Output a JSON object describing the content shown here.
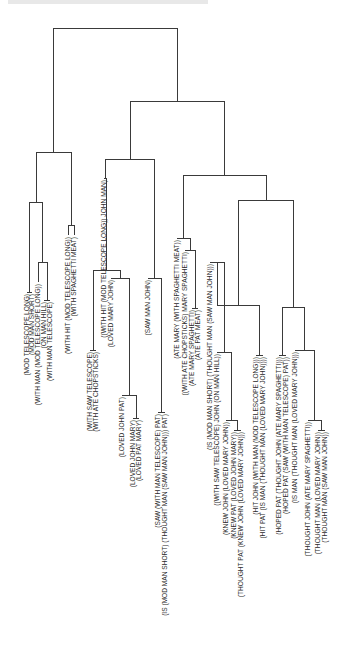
{
  "figure": {
    "type": "dendrogram",
    "orientation": "root-top, leaves-bottom, labels rotated -90deg",
    "line_color": "#3a3a3a",
    "background": "#ffffff"
  },
  "leaves": [
    {
      "id": "L1",
      "x": 27,
      "y": 292,
      "label": "(MOD TELESCOPE LONG)"
    },
    {
      "id": "L2",
      "x": 32,
      "y": 292,
      "label": "(MOD MAN SHORT)"
    },
    {
      "id": "L3",
      "x": 38,
      "y": 282,
      "label": "(WITH MAN (MOD TELESCOPE LONG))"
    },
    {
      "id": "L4",
      "x": 44,
      "y": 300,
      "label": "(ON MAN HILL)"
    },
    {
      "id": "L5",
      "x": 50,
      "y": 300,
      "label": "(WITH MAN TELESCOPE)"
    },
    {
      "id": "L6",
      "x": 68,
      "y": 235,
      "label": "(WITH HIT (MOD TELESCOPE LONG))"
    },
    {
      "id": "L7",
      "x": 74,
      "y": 235,
      "label": "(WITH SPAGHETTI MEAT)"
    },
    {
      "id": "L8",
      "x": 90,
      "y": 350,
      "label": "(WITH SAW TELESCOPE)"
    },
    {
      "id": "L9",
      "x": 96,
      "y": 350,
      "label": "(WITH ATE CHOPSTICKS)"
    },
    {
      "id": "L10",
      "x": 104,
      "y": 178,
      "label": "((WITH HIT (MOD TELESCOPE LONG)) JOHN MAN)"
    },
    {
      "id": "L11",
      "x": 111,
      "y": 278,
      "label": "(LOVED MARY JOHN)"
    },
    {
      "id": "L12",
      "x": 122,
      "y": 395,
      "label": "(LOVED JOHN PAT)"
    },
    {
      "id": "L13",
      "x": 133,
      "y": 418,
      "label": "(LOVED JOHN MARY)"
    },
    {
      "id": "L14",
      "x": 139,
      "y": 418,
      "label": "(LOVED PAT MARY)"
    },
    {
      "id": "L15",
      "x": 148,
      "y": 278,
      "label": "(SAW MAN JOHN)"
    },
    {
      "id": "L16",
      "x": 158,
      "y": 412,
      "label": "(SAW (WITH MAN TELESCOPE) PAT)"
    },
    {
      "id": "L17",
      "x": 165,
      "y": 412,
      "label": "(IS (MOD MAN SHORT) (THOUGHT MAN (SAW MAN JOHN))) PAT)"
    },
    {
      "id": "L18",
      "x": 177,
      "y": 238,
      "label": "(ATE MARY (WITH SPAGHETTI MEAT))"
    },
    {
      "id": "L19",
      "x": 185,
      "y": 250,
      "label": "((WITH ATE CHOPSTICKS) MARY SPAGHETTI)"
    },
    {
      "id": "L20",
      "x": 192,
      "y": 308,
      "label": "(ATE MARY SPAGHETTI)"
    },
    {
      "id": "L21",
      "x": 198,
      "y": 308,
      "label": "(ATE PAT MEAT)"
    },
    {
      "id": "L22",
      "x": 210,
      "y": 262,
      "label": "(IS (MOD MAN SHORT) (THOUGHT MAN (SAW MAN JOHN)))"
    },
    {
      "id": "L23",
      "x": 217,
      "y": 352,
      "label": "((WITH SAW TELESCOPE) JOHN (ON MAN HILL))"
    },
    {
      "id": "L24",
      "x": 226,
      "y": 420,
      "label": "(KNEW JOHN (LOVED MARY JOHN))"
    },
    {
      "id": "L25",
      "x": 234,
      "y": 430,
      "label": "(KNEW PAT (LOVED JOHN MARY))"
    },
    {
      "id": "L26",
      "x": 241,
      "y": 430,
      "label": "(THOUGHT PAT (KNEW JOHN (LOVED MARY JOHN)))"
    },
    {
      "id": "L27",
      "x": 256,
      "y": 355,
      "label": "(HIT JOHN (WITH MAN (MOD TELESCOPE LONG)))"
    },
    {
      "id": "L28",
      "x": 263,
      "y": 355,
      "label": "(HIT PAT (IS MAN (THOUGHT MAN (LOVED MARY JOHN))))"
    },
    {
      "id": "L29",
      "x": 279,
      "y": 355,
      "label": "(HOPED PAT (THOUGHT JOHN (ATE MARY SPAGHETTI)))"
    },
    {
      "id": "L30",
      "x": 286,
      "y": 355,
      "label": "(HOPED PAT (SAW (WITH MAN TELESCOPE) PAT))"
    },
    {
      "id": "L31",
      "x": 295,
      "y": 350,
      "label": "(IS MAN (THOUGHT MAN (LOVED MARY JOHN)))"
    },
    {
      "id": "L32",
      "x": 308,
      "y": 420,
      "label": "(THOUGHT JOHN (ATE MARY SPAGHETTI))"
    },
    {
      "id": "L33",
      "x": 318,
      "y": 430,
      "label": "(THOUGHT MAN (LOVED MARY JOHN))"
    },
    {
      "id": "L34",
      "x": 325,
      "y": 430,
      "label": "(THOUGHT MAN (SAW MAN JOHN))"
    }
  ],
  "merges": [
    {
      "id": "M1",
      "y": 292,
      "children": [
        "L1",
        "L2"
      ]
    },
    {
      "id": "M2",
      "y": 300,
      "children": [
        "L4",
        "L5"
      ]
    },
    {
      "id": "M3",
      "y": 262,
      "children": [
        "L3",
        "M2"
      ]
    },
    {
      "id": "M4",
      "y": 225,
      "children": [
        "L6",
        "L7"
      ]
    },
    {
      "id": "M5",
      "y": 202,
      "children": [
        "M1",
        "M3"
      ]
    },
    {
      "id": "M6",
      "y": 152,
      "children": [
        "M5",
        "M4"
      ]
    },
    {
      "id": "M7",
      "y": 350,
      "children": [
        "L8",
        "L9"
      ]
    },
    {
      "id": "M8",
      "y": 418,
      "children": [
        "L13",
        "L14"
      ]
    },
    {
      "id": "M9",
      "y": 395,
      "children": [
        "L12",
        "M8"
      ]
    },
    {
      "id": "M10",
      "y": 278,
      "children": [
        "L11",
        "M9"
      ]
    },
    {
      "id": "M11",
      "y": 270,
      "children": [
        "M7",
        "M10"
      ]
    },
    {
      "id": "M12",
      "y": 178,
      "children": [
        "L10",
        "M11"
      ]
    },
    {
      "id": "M13",
      "y": 412,
      "children": [
        "L16",
        "L17"
      ]
    },
    {
      "id": "M14",
      "y": 278,
      "children": [
        "L15",
        "M13"
      ]
    },
    {
      "id": "M15",
      "y": 159,
      "children": [
        "M12",
        "M14"
      ]
    },
    {
      "id": "M16",
      "y": 308,
      "children": [
        "L20",
        "L21"
      ]
    },
    {
      "id": "M17",
      "y": 250,
      "children": [
        "L19",
        "M16"
      ]
    },
    {
      "id": "M18",
      "y": 238,
      "children": [
        "L18",
        "M17"
      ]
    },
    {
      "id": "M19",
      "y": 430,
      "children": [
        "L25",
        "L26"
      ]
    },
    {
      "id": "M20",
      "y": 420,
      "children": [
        "L24",
        "M19"
      ]
    },
    {
      "id": "M21",
      "y": 352,
      "children": [
        "L23",
        "M20"
      ]
    },
    {
      "id": "M22",
      "y": 262,
      "children": [
        "L22",
        "M21"
      ]
    },
    {
      "id": "M23",
      "y": 355,
      "children": [
        "L27",
        "L28"
      ]
    },
    {
      "id": "M24",
      "y": 305,
      "children": [
        "M22",
        "M23"
      ]
    },
    {
      "id": "M25",
      "y": 355,
      "children": [
        "L29",
        "L30"
      ]
    },
    {
      "id": "M26",
      "y": 430,
      "children": [
        "L33",
        "L34"
      ]
    },
    {
      "id": "M27",
      "y": 420,
      "children": [
        "L32",
        "M26"
      ]
    },
    {
      "id": "M28",
      "y": 350,
      "children": [
        "L31",
        "M27"
      ]
    },
    {
      "id": "M29",
      "y": 307,
      "children": [
        "M25",
        "M28"
      ]
    },
    {
      "id": "M30",
      "y": 200,
      "children": [
        "M24",
        "M29"
      ]
    },
    {
      "id": "M31",
      "y": 175,
      "children": [
        "M18",
        "M30"
      ]
    },
    {
      "id": "M32",
      "y": 142,
      "children": [
        "M31",
        "M31b"
      ]
    },
    {
      "id": "M33",
      "y": 101,
      "children": [
        "M15",
        "M32"
      ]
    },
    {
      "id": "M34",
      "y": 75,
      "children": [
        "M33",
        "M33b"
      ]
    },
    {
      "id": "ROOT",
      "y": 28,
      "children": [
        "M6",
        "M34"
      ]
    }
  ],
  "header": {
    "caption_fragment": "(illegible header text, cut off at top edge)"
  }
}
